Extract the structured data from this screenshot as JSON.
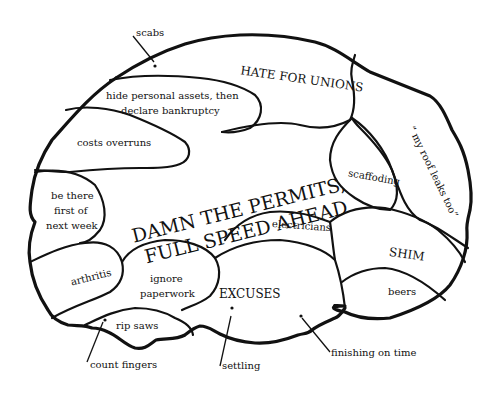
{
  "diagram": {
    "type": "labeled brain map (humor)",
    "center": {
      "line1": "DAMN THE PERMITS,",
      "line2": "FULL SPEED AHEAD"
    },
    "regions": {
      "hate_for_unions": "HATE FOR UNIONS",
      "hide_assets_line1": "hide personal assets, then",
      "hide_assets_line2": "declare bankruptcy",
      "costs_overruns": "costs overruns",
      "be_there_line1": "be there",
      "be_there_line2": "first of",
      "be_there_line3": "next week",
      "arthritis": "arthritis",
      "ignore_line1": "ignore",
      "ignore_line2": "paperwork",
      "rip_saws": "rip saws",
      "excuses": "EXCUSES",
      "electricians": "electricians",
      "scaffoding": "scaffoding",
      "roof_leaks": "“ my roof leaks too”",
      "shim": "SHIM",
      "beers": "beers"
    },
    "callouts": {
      "scabs": "scabs",
      "count_fingers": "count fingers",
      "settling": "settling",
      "finishing_on_time": "finishing on time"
    }
  }
}
